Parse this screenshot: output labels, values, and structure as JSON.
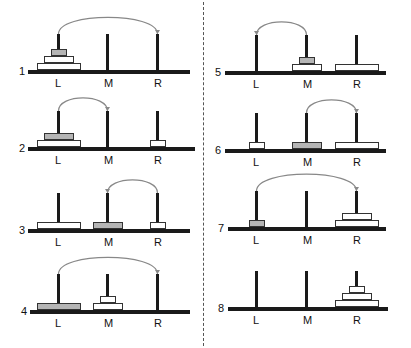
{
  "diagram": {
    "peg_labels": [
      "L",
      "M",
      "R"
    ],
    "colors": {
      "base": "#1a1a1a",
      "disc_fill": "#ffffff",
      "disc_shaded": "#b5b5b5",
      "arrow": "#888888",
      "divider": "#555555"
    },
    "disc_sizes": {
      "small": 16,
      "medium": 30,
      "large": 44
    },
    "panels": [
      {
        "number": "1",
        "move": {
          "from": "L",
          "to": "R"
        },
        "pegs": {
          "L": [
            {
              "size": "large"
            },
            {
              "size": "medium"
            },
            {
              "size": "small",
              "shaded": true
            }
          ],
          "M": [],
          "R": []
        }
      },
      {
        "number": "2",
        "move": {
          "from": "L",
          "to": "M"
        },
        "pegs": {
          "L": [
            {
              "size": "large"
            },
            {
              "size": "medium",
              "shaded": true
            }
          ],
          "M": [],
          "R": [
            {
              "size": "small"
            }
          ]
        }
      },
      {
        "number": "3",
        "move": {
          "from": "R",
          "to": "M"
        },
        "pegs": {
          "L": [
            {
              "size": "large"
            }
          ],
          "M": [
            {
              "size": "medium",
              "shaded": true
            }
          ],
          "R": [
            {
              "size": "small"
            }
          ]
        }
      },
      {
        "number": "4",
        "move": {
          "from": "L",
          "to": "R"
        },
        "pegs": {
          "L": [
            {
              "size": "large",
              "shaded": true
            }
          ],
          "M": [
            {
              "size": "medium"
            },
            {
              "size": "small"
            }
          ],
          "R": []
        }
      },
      {
        "number": "5",
        "move": {
          "from": "M",
          "to": "L"
        },
        "pegs": {
          "L": [],
          "M": [
            {
              "size": "medium"
            },
            {
              "size": "small",
              "shaded": true
            }
          ],
          "R": [
            {
              "size": "large"
            }
          ]
        }
      },
      {
        "number": "6",
        "move": {
          "from": "M",
          "to": "R"
        },
        "pegs": {
          "L": [
            {
              "size": "small"
            }
          ],
          "M": [
            {
              "size": "medium",
              "shaded": true
            }
          ],
          "R": [
            {
              "size": "large"
            }
          ]
        }
      },
      {
        "number": "7",
        "move": {
          "from": "L",
          "to": "R"
        },
        "pegs": {
          "L": [
            {
              "size": "small",
              "shaded": true
            }
          ],
          "M": [],
          "R": [
            {
              "size": "large"
            },
            {
              "size": "medium"
            }
          ]
        }
      },
      {
        "number": "8",
        "move": null,
        "pegs": {
          "L": [],
          "M": [],
          "R": [
            {
              "size": "large"
            },
            {
              "size": "medium"
            },
            {
              "size": "small"
            }
          ]
        }
      }
    ]
  }
}
